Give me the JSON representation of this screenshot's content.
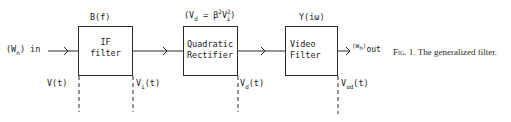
{
  "figure": {
    "caption_prefix": "Fig. 1.",
    "caption_text": "The generalized filter.",
    "input_label": "(W",
    "input_sub": "n",
    "input_suffix": ") in",
    "output_label": "(W",
    "output_sub": "n",
    "output_suffix": ")",
    "output_sub2": "out",
    "blocks": [
      {
        "id": "if-filter",
        "transfer_label": "B(f)",
        "lines": [
          "IF",
          "filter"
        ],
        "input_signal": "V(t)",
        "output_signal_main": "V",
        "output_signal_sub": "i",
        "output_signal_suffix": "(t)"
      },
      {
        "id": "quadratic-rectifier",
        "transfer_label_prefix": "(V",
        "transfer_label_sub": "d",
        "transfer_label_eq": " = β",
        "transfer_label_sup1": "2",
        "transfer_label_v": "V",
        "transfer_label_sup2": "2",
        "transfer_label_sub2": "i",
        "transfer_label_suffix": ")",
        "lines": [
          "Quadratic",
          "Rectifier"
        ],
        "output_signal_main": "V",
        "output_signal_sub": "d",
        "output_signal_suffix": "(t)"
      },
      {
        "id": "video-filter",
        "transfer_label": "Y(iω)",
        "lines": [
          "Video",
          "Filter"
        ],
        "output_signal_main": "V",
        "output_signal_sub": "od",
        "output_signal_suffix": "(t)"
      }
    ]
  }
}
